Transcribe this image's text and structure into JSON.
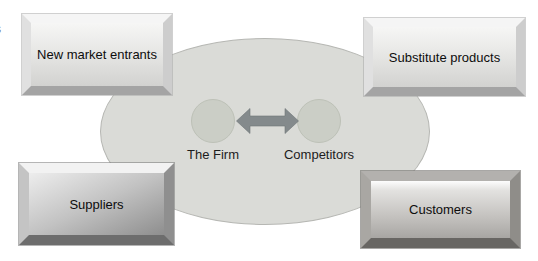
{
  "diagram": {
    "corner_boxes": [
      {
        "id": "new-market-entrants",
        "label": "New market entrants",
        "style": "light",
        "position": "top-left"
      },
      {
        "id": "substitute-products",
        "label": "Substitute products",
        "style": "light",
        "position": "top-right"
      },
      {
        "id": "suppliers",
        "label": "Suppliers",
        "style": "metal",
        "position": "bottom-left"
      },
      {
        "id": "customers",
        "label": "Customers",
        "style": "dark",
        "position": "bottom-right"
      }
    ],
    "center_nodes": [
      {
        "id": "the-firm",
        "label": "The Firm",
        "shape": "circle",
        "fill": "#cbcec6"
      },
      {
        "id": "competitors",
        "label": "Competitors",
        "shape": "circle",
        "fill": "#cbcec6"
      }
    ],
    "connector": {
      "type": "double-headed-arrow",
      "color": "#848a8c"
    },
    "ellipse": {
      "fill": "#dadbd7",
      "border": "#b6b7b3"
    },
    "edge_text_fragment": "s"
  }
}
